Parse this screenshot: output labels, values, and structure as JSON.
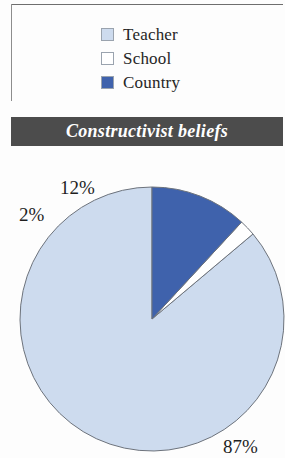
{
  "legend": {
    "items": [
      {
        "label": "Teacher",
        "color": "#cddbee",
        "swatch": "legend-swatch-teacher"
      },
      {
        "label": "School",
        "color": "#ffffff",
        "swatch": "legend-swatch-school"
      },
      {
        "label": "Country",
        "color": "#3f62ac",
        "swatch": "legend-swatch-country"
      }
    ]
  },
  "title": {
    "text": "Constructivist beliefs"
  },
  "labels": {
    "teacher_pct": "87%",
    "school_pct": "2%",
    "country_pct": "12%"
  },
  "chart_data": {
    "type": "pie",
    "title": "Constructivist beliefs",
    "categories": [
      "Teacher",
      "School",
      "Country"
    ],
    "values": [
      87,
      2,
      12
    ],
    "value_labels": [
      "87%",
      "2%",
      "12%"
    ],
    "colors": [
      "#cddbee",
      "#ffffff",
      "#3f62ac"
    ],
    "units": "percent",
    "legend_position": "top",
    "start_angle_deg": 90,
    "direction": "counterclockwise",
    "grid": false
  }
}
